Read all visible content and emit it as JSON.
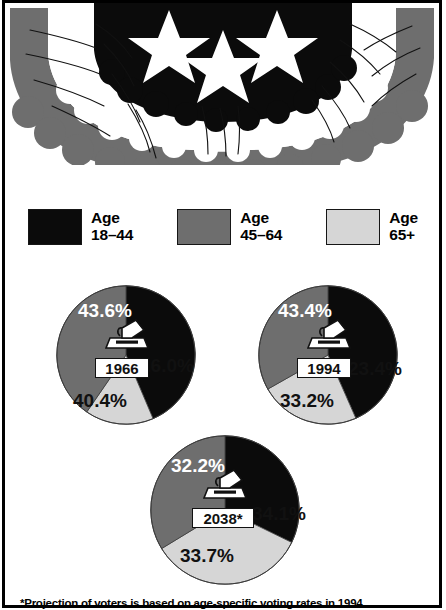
{
  "graphic": {
    "type": "bunting-decoration",
    "description": "patriotic half-round bunting with three white stars"
  },
  "legend": {
    "items": [
      {
        "label_line1": "Age",
        "label_line2": "18–44",
        "color": "#0b0b0b",
        "swatch_name": "swatch-age-18-44"
      },
      {
        "label_line1": "Age",
        "label_line2": "45–64",
        "color": "#6e6e6e",
        "swatch_name": "swatch-age-45-64"
      },
      {
        "label_line1": "Age",
        "label_line2": "65+",
        "color": "#d6d6d6",
        "swatch_name": "swatch-age-65-plus"
      }
    ]
  },
  "footnote": {
    "text": "*Projection of voters is based on age-specific voting rates in 1994"
  },
  "chart_data": [
    {
      "type": "pie",
      "title": "1966",
      "year_label": "1966",
      "categories": [
        "Age 18–44",
        "Age 45–64",
        "Age 65+"
      ],
      "values": [
        43.6,
        40.4,
        16.0
      ],
      "labels": [
        "43.6%",
        "40.4%",
        "16.0%"
      ],
      "colors": [
        "#0b0b0b",
        "#6e6e6e",
        "#d6d6d6"
      ],
      "start_angle": 0,
      "direction": "clockwise",
      "legend": "shared"
    },
    {
      "type": "pie",
      "title": "1994",
      "year_label": "1994",
      "categories": [
        "Age 18–44",
        "Age 45–64",
        "Age 65+"
      ],
      "values": [
        43.4,
        33.2,
        23.4
      ],
      "labels": [
        "43.4%",
        "33.2%",
        "23.4%"
      ],
      "colors": [
        "#0b0b0b",
        "#6e6e6e",
        "#d6d6d6"
      ],
      "start_angle": 0,
      "direction": "clockwise",
      "legend": "shared"
    },
    {
      "type": "pie",
      "title": "2038*",
      "year_label": "2038*",
      "categories": [
        "Age 18–44",
        "Age 45–64",
        "Age 65+"
      ],
      "values": [
        32.2,
        33.7,
        34.1
      ],
      "labels": [
        "32.2%",
        "33.7%",
        "34.1%"
      ],
      "colors": [
        "#0b0b0b",
        "#6e6e6e",
        "#d6d6d6"
      ],
      "start_angle": 0,
      "direction": "clockwise",
      "legend": "shared"
    }
  ]
}
